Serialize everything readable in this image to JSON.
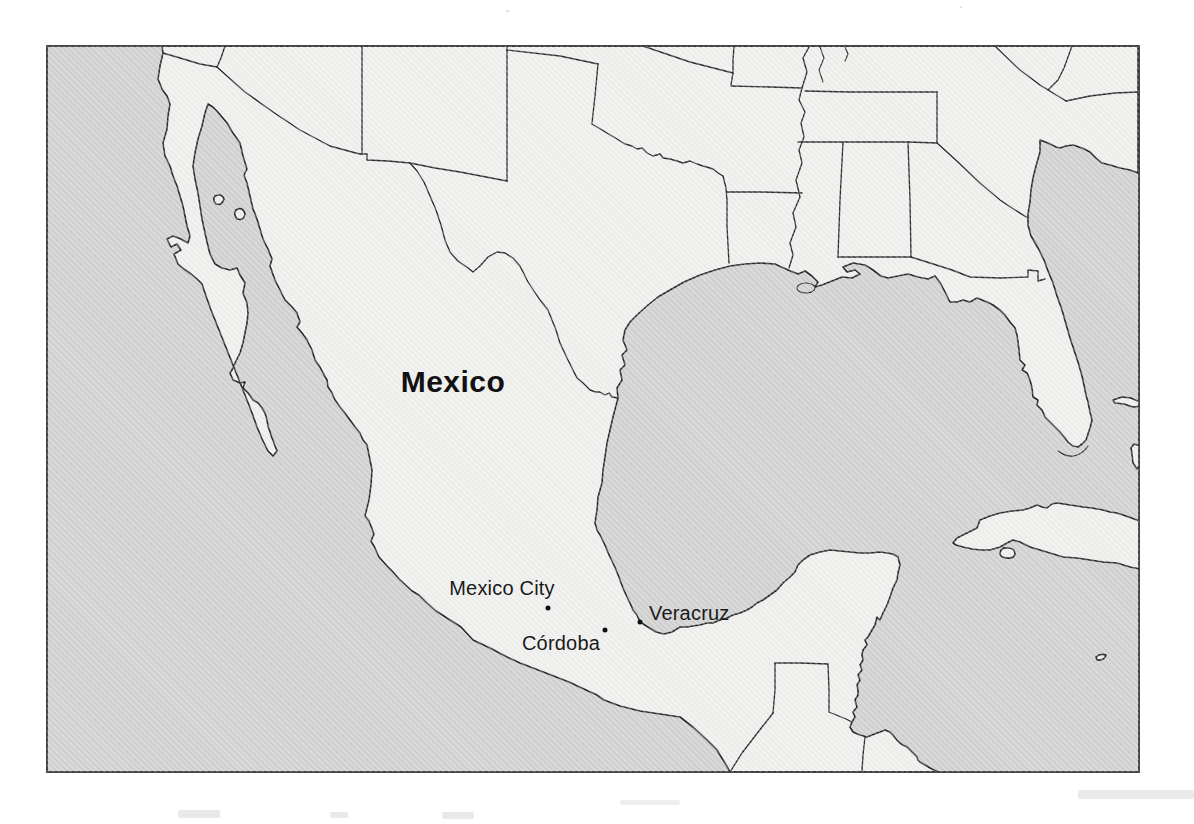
{
  "map": {
    "country_label": "Mexico",
    "country_label_x": 453,
    "country_label_y": 382,
    "cities": [
      {
        "name": "Mexico City",
        "dot_x": 548,
        "dot_y": 608,
        "label_x": 502,
        "label_y": 588,
        "label_align": "center"
      },
      {
        "name": "Córdoba",
        "dot_x": 605,
        "dot_y": 630,
        "label_x": 561,
        "label_y": 643,
        "label_align": "center"
      },
      {
        "name": "Veracruz",
        "dot_x": 640,
        "dot_y": 622,
        "label_x": 649,
        "label_y": 613,
        "label_align": "left"
      }
    ],
    "colors": {
      "page": "#ffffff",
      "water": "#d1d1d1",
      "land": "#efefee",
      "outline": "#2b2b2b",
      "frame": "#333333"
    }
  }
}
